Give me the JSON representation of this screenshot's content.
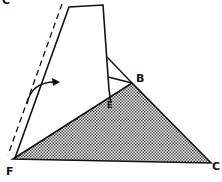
{
  "diagram": {
    "type": "geometry-fold",
    "labels": {
      "top_left_partial": "C",
      "B": "B",
      "E": "E",
      "F": "F",
      "C": "C"
    },
    "points": {
      "F": [
        13,
        159
      ],
      "C": [
        211,
        163
      ],
      "B": [
        132,
        83
      ],
      "E": [
        111,
        103
      ]
    },
    "shaded_triangle": "F-B-C",
    "folded_flap": "trapezoid with dashed fold line and curved arrow",
    "colors": {
      "stroke": "#111111",
      "fill_pattern": "#555555",
      "background": "#ffffff"
    }
  }
}
